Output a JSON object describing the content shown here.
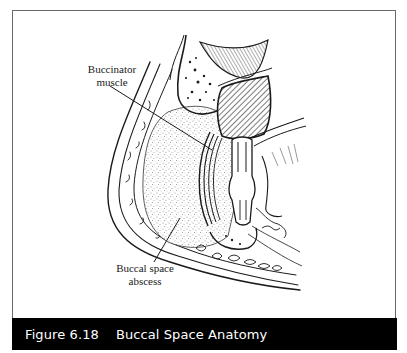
{
  "figure": {
    "number": "Figure 6.18",
    "title": "Buccal Space Anatomy",
    "labels": {
      "buccinator": "Buccinator muscle",
      "abscess": "Buccal space abscess"
    },
    "colors": {
      "caption_bg": "#000000",
      "caption_text": "#ffffff",
      "frame_border": "#6a6a6a",
      "ink": "#1a1a1a"
    }
  }
}
